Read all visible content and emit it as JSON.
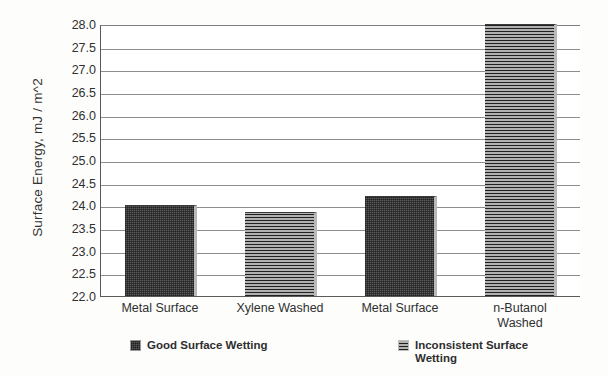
{
  "chart_data": {
    "type": "bar",
    "title": "",
    "subtitle": "",
    "xlabel": "",
    "ylabel": "Surface Energy, mJ / m^2",
    "categories": [
      "Metal Surface",
      "Xylene Washed",
      "Metal Surface",
      "n-Butanol\nWashed"
    ],
    "values": [
      24.0,
      23.85,
      24.2,
      28.0
    ],
    "ylim": [
      22.0,
      28.0
    ],
    "ytick_labels": [
      "28.0",
      "27.5",
      "27.0",
      "26.5",
      "26.0",
      "25.5",
      "25.0",
      "24.5",
      "24.0",
      "23.5",
      "23.0",
      "22.5",
      "22.0"
    ],
    "ytick_values": [
      28.0,
      27.5,
      27.0,
      26.5,
      26.0,
      25.5,
      25.0,
      24.5,
      24.0,
      23.5,
      23.0,
      22.5,
      22.0
    ],
    "grid": true,
    "legend_position": "bottom",
    "series": [
      {
        "name": "Good Surface Wetting",
        "pattern": "crosshatch",
        "color": "#5b5b5b",
        "bars": [
          {
            "category": "Metal Surface",
            "value": 24.0
          },
          {
            "category": "Metal Surface",
            "value": 24.2
          }
        ]
      },
      {
        "name": "Inconsistent Surface Wetting",
        "pattern": "horizontal-lines",
        "color": "#6a6a6a",
        "bars": [
          {
            "category": "Xylene Washed",
            "value": 23.85
          },
          {
            "category": "n-Butanol Washed",
            "value": 28.0
          }
        ]
      }
    ],
    "bar_series_index": [
      0,
      1,
      0,
      1
    ]
  },
  "legend": {
    "items": [
      {
        "label": "Good Surface Wetting",
        "pattern": "crosshatch"
      },
      {
        "label": "Inconsistent Surface\nWetting",
        "pattern": "horizontal-lines"
      }
    ]
  },
  "axis": {
    "y_title": "Surface Energy, mJ / m^2"
  }
}
